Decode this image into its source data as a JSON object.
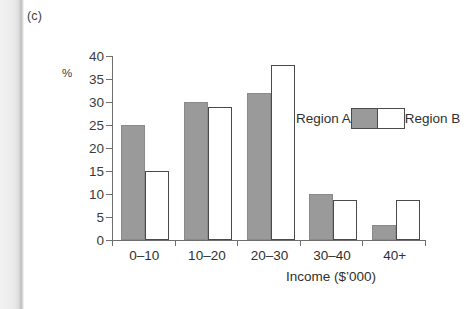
{
  "figure": {
    "panel_label": "(c)"
  },
  "chart_data": {
    "type": "bar",
    "title": "",
    "subtitle": "",
    "categories": [
      "0–10",
      "10–20",
      "20–30",
      "30–40",
      "40+"
    ],
    "series": [
      {
        "name": "Region A",
        "values": [
          25,
          30,
          32,
          10,
          3.3
        ],
        "color": "#9a9a9a",
        "border_color": "#8a8a8a"
      },
      {
        "name": "Region B",
        "values": [
          15,
          29,
          38,
          8.8,
          8.8
        ],
        "color": "#ffffff",
        "border_color": "#4a4a4a"
      }
    ],
    "xlabel": "Income ($’000)",
    "ylabel": "%",
    "ylim": [
      0,
      40
    ],
    "ytick_step": 5,
    "yticks": [
      0,
      5,
      10,
      15,
      20,
      25,
      30,
      35,
      40
    ],
    "ytick_labels": [
      "0",
      "5",
      "10",
      "15",
      "20",
      "25",
      "30",
      "35",
      "40"
    ],
    "grid": false,
    "legend_position": "inside-right",
    "axis_color": "#6f6f6f"
  }
}
